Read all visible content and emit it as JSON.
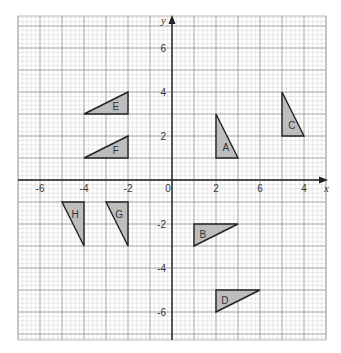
{
  "diagram": {
    "title": "",
    "axes": {
      "x_label": "x",
      "y_label": "y",
      "x_ticks": [
        {
          "value": -6,
          "label": "-6"
        },
        {
          "value": -4,
          "label": "-4"
        },
        {
          "value": -2,
          "label": "-2"
        },
        {
          "value": 0,
          "label": "0"
        },
        {
          "value": 2,
          "label": "2"
        },
        {
          "value": 4,
          "label": "6"
        },
        {
          "value": 6,
          "label": "4"
        }
      ],
      "y_ticks": [
        {
          "value": 6,
          "label": "6"
        },
        {
          "value": 4,
          "label": "4"
        },
        {
          "value": 2,
          "label": "2"
        },
        {
          "value": -2,
          "label": "-2"
        },
        {
          "value": -4,
          "label": "-4"
        },
        {
          "value": -6,
          "label": "-6"
        }
      ]
    },
    "grid": {
      "origin_px": [
        172,
        180
      ],
      "unit_px": 22,
      "minor_per_unit": 5,
      "bounds_px": {
        "left": 18,
        "right": 326,
        "top": 16,
        "bottom": 340
      }
    },
    "colors": {
      "fill": "#bdbdbd",
      "stroke": "#222222",
      "major_grid": "#9a9a9a",
      "minor_grid": "#d2d2d2",
      "axis": "#222222"
    },
    "shapes": [
      {
        "label": "A",
        "points": [
          [
            2,
            1
          ],
          [
            2,
            3
          ],
          [
            3,
            1
          ]
        ],
        "label_pos": [
          2.45,
          1.5
        ]
      },
      {
        "label": "B",
        "points": [
          [
            1,
            -2
          ],
          [
            3,
            -2
          ],
          [
            1,
            -3
          ]
        ],
        "label_pos": [
          1.4,
          -2.45
        ]
      },
      {
        "label": "C",
        "points": [
          [
            5,
            2
          ],
          [
            5,
            4
          ],
          [
            6,
            2
          ]
        ],
        "label_pos": [
          5.45,
          2.5
        ]
      },
      {
        "label": "D",
        "points": [
          [
            2,
            -5
          ],
          [
            4,
            -5
          ],
          [
            2,
            -6
          ]
        ],
        "label_pos": [
          2.4,
          -5.45
        ]
      },
      {
        "label": "E",
        "points": [
          [
            -4,
            3
          ],
          [
            -2,
            3
          ],
          [
            -2,
            4
          ]
        ],
        "label_pos": [
          -2.55,
          3.35
        ]
      },
      {
        "label": "F",
        "points": [
          [
            -4,
            1
          ],
          [
            -2,
            1
          ],
          [
            -2,
            2
          ]
        ],
        "label_pos": [
          -2.55,
          1.35
        ]
      },
      {
        "label": "G",
        "points": [
          [
            -3,
            -1
          ],
          [
            -2,
            -1
          ],
          [
            -2,
            -3
          ]
        ],
        "label_pos": [
          -2.4,
          -1.55
        ]
      },
      {
        "label": "H",
        "points": [
          [
            -5,
            -1
          ],
          [
            -4,
            -1
          ],
          [
            -4,
            -3
          ]
        ],
        "label_pos": [
          -4.4,
          -1.55
        ]
      }
    ]
  }
}
